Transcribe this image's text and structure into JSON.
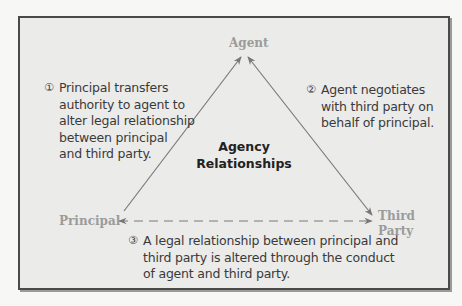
{
  "diagram": {
    "title": [
      "Agency",
      "Relationships"
    ],
    "nodes": {
      "agent": "Agent",
      "principal": "Principal",
      "third_party": [
        "Third",
        "Party"
      ]
    },
    "notes": [
      {
        "number": "①",
        "lines": [
          "Principal transfers",
          "authority to agent to",
          "alter legal relationship",
          "between principal",
          "and third party."
        ]
      },
      {
        "number": "②",
        "lines": [
          "Agent negotiates",
          "with third party on",
          "behalf of principal."
        ]
      },
      {
        "number": "③",
        "lines": [
          "A legal relationship between principal and",
          "third party is altered through the conduct",
          "of agent and third party."
        ]
      }
    ],
    "edges": [
      {
        "from": "Principal",
        "to": "Agent",
        "style": "solid",
        "arrow": "end"
      },
      {
        "from": "Agent",
        "to": "Third Party",
        "style": "solid",
        "arrow": "both"
      },
      {
        "from": "Principal",
        "to": "Third Party",
        "style": "dashed",
        "arrow": "both"
      }
    ],
    "colors": {
      "frame_bg": "#ebebea",
      "frame_border": "#4a4a4a",
      "node_text": "#9b9b9b",
      "edge": "#7a7a7a",
      "title_text": "#222222",
      "note_text": "#3a3a3a"
    }
  }
}
